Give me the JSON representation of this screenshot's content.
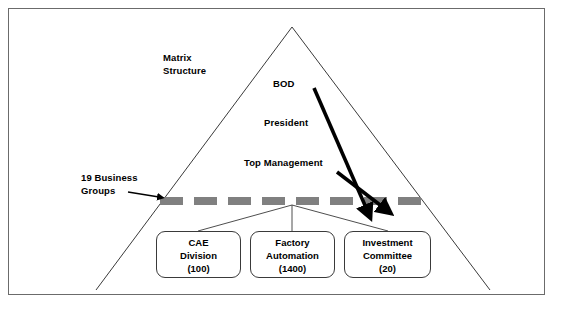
{
  "diagram": {
    "title_label": "Matrix\nStructure",
    "hierarchy": [
      {
        "name": "bod",
        "label": "BOD"
      },
      {
        "name": "president",
        "label": "President"
      },
      {
        "name": "top-management",
        "label": "Top Management"
      }
    ],
    "business_groups_label": "19 Business\nGroups",
    "boxes": [
      {
        "name": "cae-division",
        "line1": "CAE",
        "line2": "Division",
        "line3": "(100)"
      },
      {
        "name": "factory-automation",
        "line1": "Factory",
        "line2": "Automation",
        "line3": "(1400)"
      },
      {
        "name": "investment-committee",
        "line1": "Investment",
        "line2": "Committee",
        "line3": "(20)"
      }
    ],
    "colors": {
      "frame_border": "#6b6b6b",
      "triangle_stroke": "#3a3a3a",
      "dashed_line": "#808080",
      "arrow_thick": "#000000",
      "box_border": "#3a3a3a",
      "text": "#000000",
      "background": "#ffffff"
    }
  }
}
